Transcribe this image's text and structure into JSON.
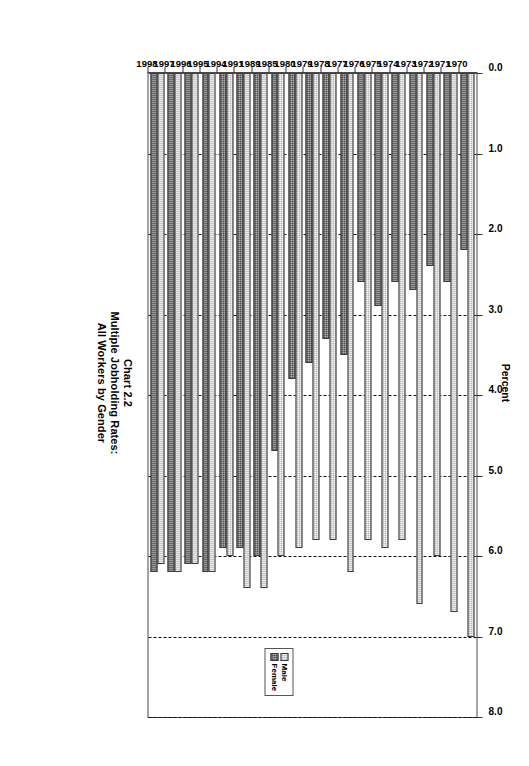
{
  "chart_data": {
    "type": "bar",
    "orientation": "horizontal",
    "title": "Chart 2.2",
    "subtitle_lines": [
      "Multiple Jobholding Rates:",
      "All Workers by Gender"
    ],
    "xlabel": "Percent",
    "ylabel": "",
    "xlim": [
      0.0,
      8.0
    ],
    "xticks": [
      "0.0",
      "1.0",
      "2.0",
      "3.0",
      "4.0",
      "5.0",
      "6.0",
      "7.0",
      "8.0"
    ],
    "grid": true,
    "grid_style": "dashed",
    "legend_position": "inside-right",
    "categories": [
      "1970",
      "1971",
      "1972",
      "1973",
      "1974",
      "1975",
      "1976",
      "1977",
      "1978",
      "1979",
      "1980",
      "1985",
      "1989",
      "1991",
      "1994",
      "1995",
      "1996",
      "1997",
      "1998"
    ],
    "series": [
      {
        "name": "Male",
        "color": "#b6b6b6",
        "values": [
          7.0,
          6.7,
          6.0,
          6.6,
          5.8,
          5.9,
          5.8,
          6.2,
          5.8,
          5.8,
          5.9,
          6.0,
          6.4,
          6.4,
          6.0,
          6.2,
          6.1,
          6.2,
          6.1
        ]
      },
      {
        "name": "Female",
        "color": "#4e4e4e",
        "values": [
          2.2,
          2.6,
          2.4,
          2.7,
          2.6,
          2.9,
          2.6,
          3.5,
          3.3,
          3.6,
          3.8,
          4.7,
          6.0,
          5.9,
          5.9,
          6.2,
          6.1,
          6.2,
          6.2
        ]
      }
    ],
    "axis_colors": {
      "frame": "#4a4a4a",
      "gridline": "#111111",
      "text": "#000000"
    }
  },
  "legend": {
    "items": [
      {
        "label": "Male",
        "swatch": "male"
      },
      {
        "label": "Female",
        "swatch": "female"
      }
    ]
  }
}
